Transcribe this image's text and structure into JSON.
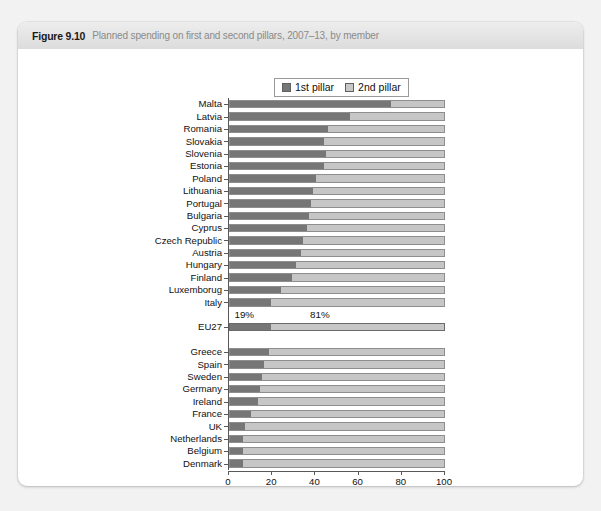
{
  "figure": {
    "number": "Figure 9.10",
    "caption": "Planned spending on first and second pillars, 2007–13, by member"
  },
  "legend": {
    "items": [
      {
        "label": "1st pillar",
        "color": "#767676"
      },
      {
        "label": "2nd pillar",
        "color": "#c6c6c6"
      }
    ]
  },
  "annotations": [
    {
      "text": "19%",
      "x_pct": 3
    },
    {
      "text": "81%",
      "x_pct": 38
    }
  ],
  "axis": {
    "title": "(%)",
    "ticks": [
      "0",
      "20",
      "40",
      "60",
      "80",
      "100"
    ],
    "min": 0,
    "max": 100
  },
  "chart_data": {
    "type": "bar",
    "orientation": "horizontal",
    "stacked": true,
    "stack_total": 100,
    "title": "Planned spending on first and second pillars, 2007–13, by member",
    "xlabel": "(%)",
    "ylabel": "",
    "xlim": [
      0,
      100
    ],
    "xticks": [
      0,
      20,
      40,
      60,
      80,
      100
    ],
    "grid": false,
    "legend_position": "top-center",
    "categories": [
      "Malta",
      "Latvia",
      "Romania",
      "Slovakia",
      "Slovenia",
      "Estonia",
      "Poland",
      "Lithuania",
      "Portugal",
      "Bulgaria",
      "Cyprus",
      "Czech Republic",
      "Austria",
      "Hungary",
      "Finland",
      "Luxemborug",
      "Italy",
      "EU27",
      "Greece",
      "Spain",
      "Sweden",
      "Germany",
      "Ireland",
      "France",
      "UK",
      "Netherlands",
      "Belgium",
      "Denmark"
    ],
    "series": [
      {
        "name": "1st pillar",
        "color": "#767676",
        "values": [
          75,
          56,
          46,
          44,
          45,
          44,
          40,
          39,
          38,
          37,
          36,
          34,
          33,
          31,
          29,
          24,
          19,
          19,
          18,
          16,
          15,
          14,
          13,
          10,
          7,
          6,
          6,
          6
        ]
      },
      {
        "name": "2nd pillar",
        "color": "#c6c6c6",
        "values": [
          25,
          44,
          54,
          56,
          55,
          56,
          60,
          61,
          62,
          63,
          64,
          66,
          67,
          69,
          71,
          76,
          81,
          81,
          82,
          84,
          85,
          86,
          87,
          90,
          93,
          94,
          94,
          94
        ]
      }
    ],
    "annotations": [
      {
        "text": "19%",
        "refers_to": "EU27 1st pillar"
      },
      {
        "text": "81%",
        "refers_to": "EU27 2nd pillar"
      }
    ],
    "group_separators_after": [
      "Italy",
      "EU27"
    ]
  }
}
